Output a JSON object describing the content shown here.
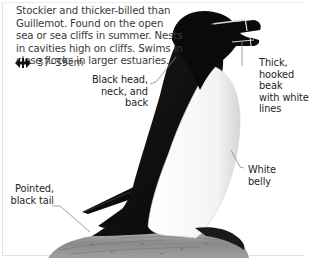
{
  "species_entry": {
    "description_lines": [
      "Stockier and thicker-billed than",
      "Guillemot. Found on the open",
      "sea or sea cliffs in summer. Nests",
      "in cavities high on cliffs. Swims in",
      "close flocks in larger estuaries."
    ],
    "size": {
      "icon": "wingspan-arrows-icon",
      "value": "37–39cm"
    }
  },
  "annotations": {
    "head": {
      "lines": [
        "Black head,",
        "neck, and back"
      ]
    },
    "beak": {
      "lines": [
        "Thick,",
        "hooked",
        "beak",
        "with white",
        "lines"
      ]
    },
    "belly": {
      "lines": [
        "White",
        "belly"
      ]
    },
    "tail": {
      "lines": [
        "Pointed,",
        "black tail"
      ]
    }
  },
  "illustration": {
    "subject": "Razorbill standing on rock",
    "colors": {
      "plumage_dark": "#111111",
      "plumage_light": "#f4f4f4",
      "rock": "#8e8e8e",
      "leader_line": "#8a8a8a"
    }
  }
}
